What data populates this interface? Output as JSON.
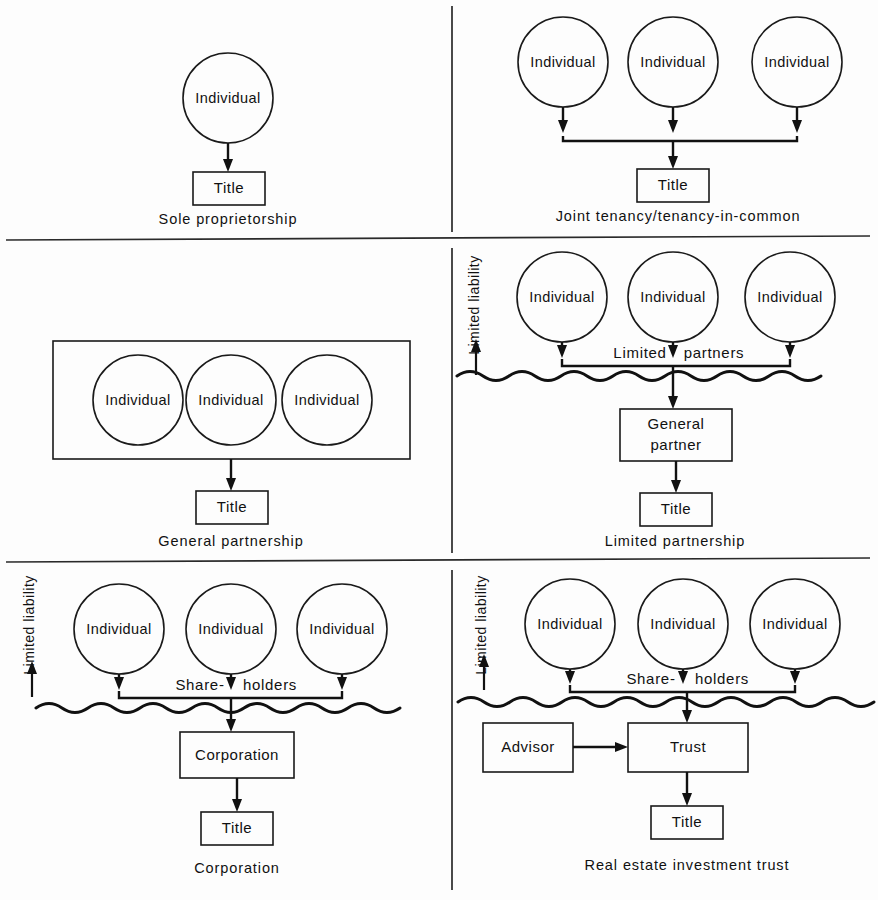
{
  "diagram": {
    "node_labels": {
      "individual": "Individual",
      "title": "Title",
      "general_partner": "General\npartner",
      "general_partner_line1": "General",
      "general_partner_line2": "partner",
      "corporation": "Corporation",
      "trust": "Trust",
      "advisor": "Advisor"
    },
    "tier_labels": {
      "limited_partners": "Limited partners",
      "limited_partners_left": "Limited",
      "limited_partners_right": "partners",
      "shareholders": "Share- holders",
      "shareholders_left": "Share-",
      "shareholders_right": "holders"
    },
    "liability_label": "Limited liability",
    "colors": {
      "ink": "#111111",
      "paper": "#fdfdfd",
      "divider": "#2a2a2a"
    },
    "panels": [
      {
        "id": "sole-proprietorship",
        "caption": "Sole proprietorship",
        "circles": [
          "Individual"
        ],
        "boxes": [
          "Title"
        ],
        "has_liability_axis": false,
        "has_wavy_line": false
      },
      {
        "id": "joint-tenancy",
        "caption": "Joint tenancy/tenancy-in-common",
        "circles": [
          "Individual",
          "Individual",
          "Individual"
        ],
        "boxes": [
          "Title"
        ],
        "has_liability_axis": false,
        "has_wavy_line": false
      },
      {
        "id": "general-partnership",
        "caption": "General partnership",
        "circles": [
          "Individual",
          "Individual",
          "Individual"
        ],
        "boxes": [
          "Title"
        ],
        "has_liability_axis": false,
        "has_wavy_line": false,
        "enclosing_box": true
      },
      {
        "id": "limited-partnership",
        "caption": "Limited partnership",
        "circles": [
          "Individual",
          "Individual",
          "Individual"
        ],
        "boxes": [
          "General partner",
          "Title"
        ],
        "tier_label": "Limited partners",
        "has_liability_axis": true,
        "has_wavy_line": true
      },
      {
        "id": "corporation",
        "caption": "Corporation",
        "circles": [
          "Individual",
          "Individual",
          "Individual"
        ],
        "boxes": [
          "Corporation",
          "Title"
        ],
        "tier_label": "Share- holders",
        "has_liability_axis": true,
        "has_wavy_line": true
      },
      {
        "id": "reit",
        "caption": "Real estate investment trust",
        "circles": [
          "Individual",
          "Individual",
          "Individual"
        ],
        "boxes": [
          "Advisor",
          "Trust",
          "Title"
        ],
        "tier_label": "Share- holders",
        "has_liability_axis": true,
        "has_wavy_line": true
      }
    ]
  }
}
